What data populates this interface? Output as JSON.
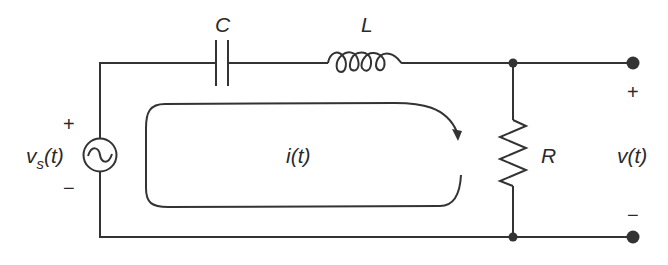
{
  "diagram": {
    "type": "series RLC circuit",
    "components": {
      "source": {
        "label": "v_s(t)",
        "label_main": "v",
        "label_sub": "s",
        "label_tail": "(t)",
        "symbol": "~",
        "polarity_plus": "+",
        "polarity_minus": "−"
      },
      "capacitor": {
        "label": "C"
      },
      "inductor": {
        "label": "L"
      },
      "resistor": {
        "label": "R"
      },
      "loop_current": {
        "label": "i(t)"
      },
      "output": {
        "label": "v(t)",
        "polarity_plus": "+",
        "polarity_minus": "−"
      }
    },
    "colors": {
      "line": "#333333",
      "background": "#ffffff"
    }
  }
}
